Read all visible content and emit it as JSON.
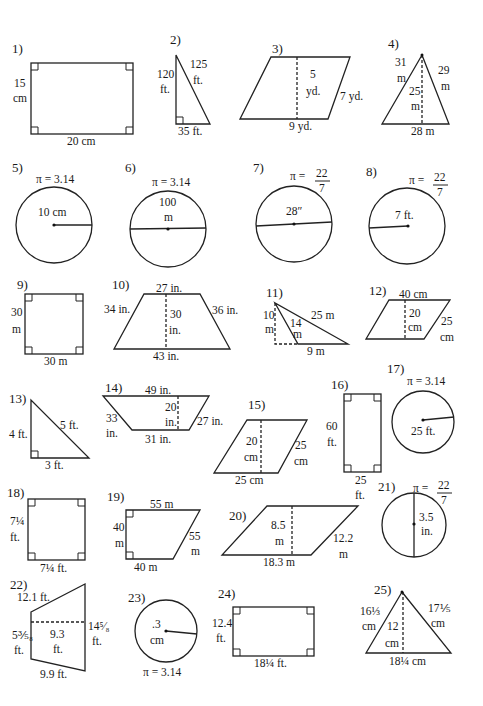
{
  "worksheet": {
    "problems": [
      {
        "number": "1)",
        "shape": "rectangle",
        "labels": {
          "side": "15",
          "side_unit": "cm",
          "base": "20 cm"
        }
      },
      {
        "number": "2)",
        "shape": "right-triangle",
        "labels": {
          "height": "120",
          "height_unit": "ft.",
          "hyp": "125",
          "hyp_unit": "ft.",
          "base": "35 ft."
        }
      },
      {
        "number": "3)",
        "shape": "parallelogram",
        "labels": {
          "height": "5",
          "height_unit": "yd.",
          "side": "7 yd.",
          "base": "9 yd."
        }
      },
      {
        "number": "4)",
        "shape": "triangle",
        "labels": {
          "left": "31",
          "left_unit": "m",
          "right": "29",
          "right_unit": "m",
          "height": "25",
          "height_unit": "m",
          "base": "28 m"
        }
      },
      {
        "number": "5)",
        "shape": "circle",
        "labels": {
          "pi": "π = 3.14",
          "radius": "10 cm"
        }
      },
      {
        "number": "6)",
        "shape": "circle",
        "labels": {
          "pi": "π = 3.14",
          "diameter": "100",
          "diameter_unit": "m"
        }
      },
      {
        "number": "7)",
        "shape": "circle",
        "labels": {
          "pi": "π =",
          "pi_num": "22",
          "pi_den": "7",
          "diameter": "28″"
        }
      },
      {
        "number": "8)",
        "shape": "circle",
        "labels": {
          "pi": "π =",
          "pi_num": "22",
          "pi_den": "7",
          "radius": "7 ft."
        }
      },
      {
        "number": "9)",
        "shape": "square",
        "labels": {
          "side": "30",
          "side_unit": "m",
          "base": "30 m"
        }
      },
      {
        "number": "10)",
        "shape": "trapezoid",
        "labels": {
          "top": "27 in.",
          "left": "34 in.",
          "height": "30",
          "height_unit": "in.",
          "right": "36 in.",
          "base": "43 in."
        }
      },
      {
        "number": "11)",
        "shape": "obtuse-triangle",
        "labels": {
          "height": "10",
          "height_unit": "m",
          "side": "14",
          "side_unit": "m",
          "long": "25 m",
          "base": "9 m"
        }
      },
      {
        "number": "12)",
        "shape": "parallelogram",
        "labels": {
          "top": "40 cm",
          "height": "20",
          "height_unit": "cm",
          "side": "25",
          "side_unit": "cm"
        }
      },
      {
        "number": "13)",
        "shape": "right-triangle",
        "labels": {
          "height": "4 ft.",
          "hyp": "5 ft.",
          "base": "3 ft."
        }
      },
      {
        "number": "14)",
        "shape": "trapezoid",
        "labels": {
          "top": "49 in.",
          "left": "33",
          "left_unit": "in.",
          "height": "20",
          "height_unit": "in.",
          "right": "27 in.",
          "base": "31 in."
        }
      },
      {
        "number": "15)",
        "shape": "parallelogram",
        "labels": {
          "height": "20",
          "height_unit": "cm",
          "side": "25",
          "side_unit": "cm",
          "base": "25 cm"
        }
      },
      {
        "number": "16)",
        "shape": "rectangle",
        "labels": {
          "side": "60",
          "side_unit": "ft.",
          "base": "25",
          "base_unit": "ft."
        }
      },
      {
        "number": "17)",
        "shape": "circle",
        "labels": {
          "pi": "π = 3.14",
          "radius": "25 ft."
        }
      },
      {
        "number": "18)",
        "shape": "square",
        "labels": {
          "side": "7¼",
          "side_unit": "ft.",
          "base": "7¼ ft."
        }
      },
      {
        "number": "19)",
        "shape": "right-trapezoid",
        "labels": {
          "top": "55 m",
          "left": "40",
          "left_unit": "m",
          "right": "55",
          "right_unit": "m",
          "base": "40 m"
        }
      },
      {
        "number": "20)",
        "shape": "parallelogram",
        "labels": {
          "height": "8.5",
          "height_unit": "m",
          "side": "12.2",
          "side_unit": "m",
          "base": "18.3 m"
        }
      },
      {
        "number": "21)",
        "shape": "circle",
        "labels": {
          "pi": "π =",
          "pi_num": "22",
          "pi_den": "7",
          "radius": "3.5",
          "radius_unit": "in."
        }
      },
      {
        "number": "22)",
        "shape": "trapezoid",
        "labels": {
          "top": "12.1 ft.",
          "left": "5⅗₈",
          "left_unit": "ft.",
          "height": "9.3",
          "height_unit": "ft.",
          "right": "14⁵⁄₈",
          "right_unit": "ft.",
          "base": "9.9 ft."
        }
      },
      {
        "number": "23)",
        "shape": "circle",
        "labels": {
          "radius": ".3",
          "radius_unit": "cm",
          "pi": "π = 3.14"
        }
      },
      {
        "number": "24)",
        "shape": "rectangle",
        "labels": {
          "side": "12.4",
          "side_unit": "ft.",
          "base": "18¼ ft."
        }
      },
      {
        "number": "25)",
        "shape": "triangle",
        "labels": {
          "left": "16⅓",
          "left_unit": "cm",
          "right": "17⅕",
          "right_unit": "cm",
          "height": "12",
          "height_unit": "cm",
          "base": "18¼ cm"
        }
      }
    ]
  }
}
